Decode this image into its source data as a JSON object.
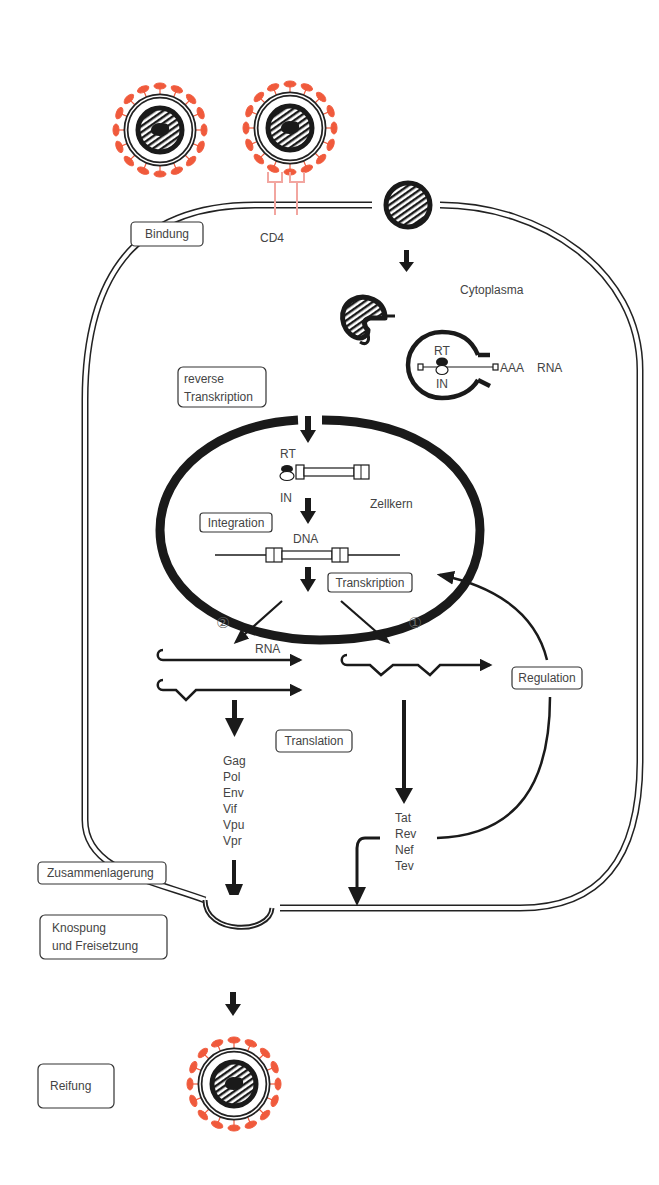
{
  "diagram": {
    "colors": {
      "spike": "#f05a3c",
      "cd4": "#f2a6a0",
      "line": "#1a1a1a",
      "text": "#444444"
    },
    "stages": [
      {
        "id": "bindung",
        "label": "Bindung"
      },
      {
        "id": "reverse-transkription",
        "label_line1": "reverse",
        "label_line2": "Transkription"
      },
      {
        "id": "integration",
        "label": "Integration"
      },
      {
        "id": "transkription",
        "label": "Transkription"
      },
      {
        "id": "translation",
        "label": "Translation"
      },
      {
        "id": "regulation",
        "label": "Regulation"
      },
      {
        "id": "zusammenlagerung",
        "label": "Zusammenlagerung"
      },
      {
        "id": "knospung",
        "label_line1": "Knospung",
        "label_line2": "und Freisetzung"
      },
      {
        "id": "reifung",
        "label": "Reifung"
      }
    ],
    "labels": {
      "cd4": "CD4",
      "cytoplasma": "Cytoplasma",
      "zellkern": "Zellkern",
      "rt": "RT",
      "in": "IN",
      "aaa": "AAA",
      "rna": "RNA",
      "dna": "DNA",
      "rt_nucleus": "RT",
      "in_nucleus": "IN",
      "rna_transcripts": "RNA",
      "pathway_1": "①",
      "pathway_2": "②"
    },
    "proteins_structural": [
      "Gag",
      "Pol",
      "Env",
      "Vif",
      "Vpu",
      "Vpr"
    ],
    "proteins_regulatory": [
      "Tat",
      "Rev",
      "Nef",
      "Tev"
    ]
  }
}
